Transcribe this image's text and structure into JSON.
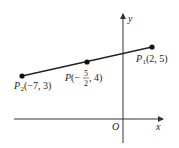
{
  "diagram": {
    "axes": {
      "x_label": "x",
      "y_label": "y",
      "origin_label": "O"
    },
    "segment": {
      "from": "P2",
      "to": "P1"
    },
    "points": [
      {
        "id": "P2",
        "name": "P",
        "subscript": "2",
        "coords_text": "(−7, 3)",
        "x": -7,
        "y": 3
      },
      {
        "id": "P",
        "name": "P",
        "subscript": "",
        "coords_prefix": "(−",
        "frac_num": "5",
        "frac_den": "2",
        "coords_suffix": ", 4)",
        "x": -2.5,
        "y": 4
      },
      {
        "id": "P1",
        "name": "P",
        "subscript": "1",
        "coords_text": "(2, 5)",
        "x": 2,
        "y": 5
      }
    ],
    "colors": {
      "line": "#222222",
      "axis": "#333333",
      "point": "#111111"
    }
  }
}
